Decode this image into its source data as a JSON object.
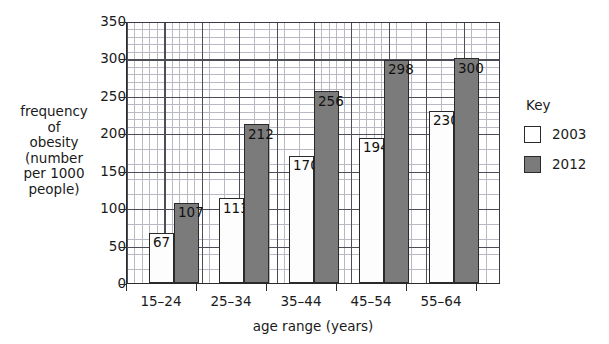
{
  "chart_data": {
    "type": "bar",
    "title": "",
    "categories": [
      "15–24",
      "25–34",
      "35–44",
      "45–54",
      "55–64"
    ],
    "series": [
      {
        "name": "2003",
        "values": [
          67,
          113,
          170,
          194,
          230
        ],
        "color": "#ffffff"
      },
      {
        "name": "2012",
        "values": [
          107,
          212,
          256,
          298,
          300
        ],
        "color": "#7b7b7b"
      }
    ],
    "xlabel": "age range (years)",
    "ylabel": "frequency of obesity (number per 1000 people)",
    "ylim": [
      0,
      350
    ],
    "ytick_labels": [
      "0",
      "50",
      "100",
      "150",
      "200",
      "250",
      "300",
      "350"
    ],
    "ytick_values": [
      0,
      50,
      100,
      150,
      200,
      250,
      300,
      350
    ],
    "minor_gridline_step": 10,
    "major_gridline_step": 50,
    "grid": true,
    "legend_position": "right",
    "legend_title": "Key"
  },
  "axes": {
    "y_label_text": "frequency\nof\nobesity\n(number\nper 1000\npeople)",
    "x_label_text": "age range (years)",
    "y_ticks": [
      {
        "label": "350",
        "value": 350
      },
      {
        "label": "300",
        "value": 300
      },
      {
        "label": "250",
        "value": 250
      },
      {
        "label": "200",
        "value": 200
      },
      {
        "label": "150",
        "value": 150
      },
      {
        "label": "100",
        "value": 100
      },
      {
        "label": "50",
        "value": 50
      },
      {
        "label": "0",
        "value": 0
      }
    ],
    "x_categories": [
      "15–24",
      "25–34",
      "35–44",
      "45–54",
      "55–64"
    ]
  },
  "bars": [
    {
      "category": "15–24",
      "series": "2003",
      "value": 67,
      "label": "67"
    },
    {
      "category": "15–24",
      "series": "2012",
      "value": 107,
      "label": "107"
    },
    {
      "category": "25–34",
      "series": "2003",
      "value": 113,
      "label": "113"
    },
    {
      "category": "25–34",
      "series": "2012",
      "value": 212,
      "label": "212"
    },
    {
      "category": "35–44",
      "series": "2003",
      "value": 170,
      "label": "170"
    },
    {
      "category": "35–44",
      "series": "2012",
      "value": 256,
      "label": "256"
    },
    {
      "category": "45–54",
      "series": "2003",
      "value": 194,
      "label": "194"
    },
    {
      "category": "45–54",
      "series": "2012",
      "value": 298,
      "label": "298"
    },
    {
      "category": "55–64",
      "series": "2003",
      "value": 230,
      "label": "230"
    },
    {
      "category": "55–64",
      "series": "2012",
      "value": 300,
      "label": "300"
    }
  ],
  "legend": {
    "title": "Key",
    "entries": [
      {
        "label": "2003",
        "swatch": "white-square-swatch"
      },
      {
        "label": "2012",
        "swatch": "gray-square-swatch"
      }
    ]
  }
}
